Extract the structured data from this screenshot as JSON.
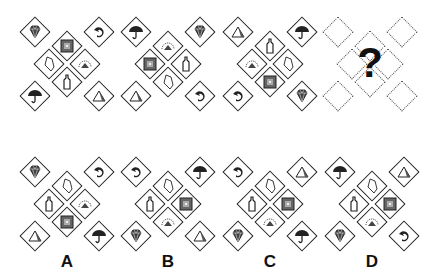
{
  "puzzle": {
    "question_mark": "?",
    "sequence": [
      {
        "corners": {
          "tl": "diamond",
          "tr": "swirl",
          "bl": "umbrella",
          "br": "pyramid"
        },
        "inner": {
          "top": "square",
          "left": "kite",
          "right": "arc",
          "bottom": "bottle"
        }
      },
      {
        "corners": {
          "tl": "umbrella",
          "tr": "diamond",
          "bl": "pyramid",
          "br": "swirl"
        },
        "inner": {
          "top": "arc",
          "left": "square",
          "right": "bottle",
          "bottom": "kite"
        }
      },
      {
        "corners": {
          "tl": "pyramid",
          "tr": "umbrella",
          "bl": "swirl",
          "br": "diamond"
        },
        "inner": {
          "top": "bottle",
          "left": "arc",
          "right": "kite",
          "bottom": "square"
        }
      }
    ],
    "options": [
      {
        "label": "A",
        "corners": {
          "tl": "diamond",
          "tr": "swirl",
          "bl": "pyramid",
          "br": "umbrella"
        },
        "inner": {
          "top": "kite",
          "left": "bottle",
          "right": "arc",
          "bottom": "square"
        }
      },
      {
        "label": "B",
        "corners": {
          "tl": "swirl",
          "tr": "umbrella",
          "bl": "diamond",
          "br": "pyramid"
        },
        "inner": {
          "top": "kite",
          "left": "bottle",
          "right": "square",
          "bottom": "arc"
        }
      },
      {
        "label": "C",
        "corners": {
          "tl": "swirl",
          "tr": "pyramid",
          "bl": "diamond",
          "br": "umbrella"
        },
        "inner": {
          "top": "kite",
          "left": "bottle",
          "right": "square",
          "bottom": "arc"
        }
      },
      {
        "label": "D",
        "corners": {
          "tl": "umbrella",
          "tr": "pyramid",
          "bl": "diamond",
          "br": "swirl"
        },
        "inner": {
          "top": "kite",
          "left": "bottle",
          "right": "square",
          "bottom": "arc"
        }
      }
    ]
  }
}
